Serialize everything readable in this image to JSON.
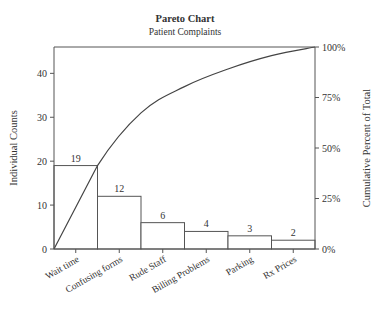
{
  "chart_data": {
    "type": "bar",
    "subtype": "pareto",
    "title": "Pareto Chart",
    "subtitle": "Patient Complaints",
    "xlabel": "",
    "ylabel": "Individual Counts",
    "y2label": "Cumulative Percent of Total",
    "categories": [
      "Wait time",
      "Confusing forms",
      "Rude Staff",
      "Billing Problems",
      "Parking",
      "Rx Prices"
    ],
    "values": [
      19,
      12,
      6,
      4,
      3,
      2
    ],
    "bar_labels": [
      "19",
      "12",
      "6",
      "4",
      "3",
      "2"
    ],
    "cumulative_percent": [
      41.3,
      67.4,
      80.4,
      89.1,
      95.7,
      100
    ],
    "ylim": [
      0,
      46
    ],
    "y2lim": [
      0,
      100
    ],
    "yticks": [
      0,
      10,
      20,
      30,
      40
    ],
    "ytick_labels": [
      "0",
      "10",
      "20",
      "30",
      "40"
    ],
    "y2ticks": [
      0,
      25,
      50,
      75,
      100
    ],
    "y2tick_labels": [
      "0%",
      "25%",
      "50%",
      "75%",
      "100%"
    ],
    "grid": false,
    "legend": "none"
  }
}
